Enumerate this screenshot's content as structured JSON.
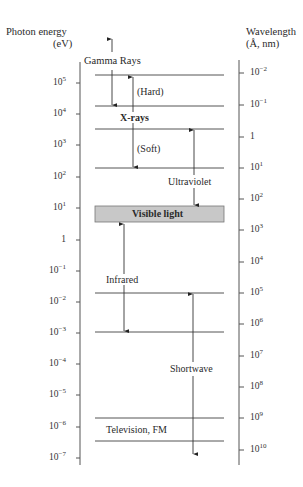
{
  "left_axis": {
    "title_line1": "Photon energy",
    "title_line2": "(eV)",
    "ticks": [
      {
        "base": "10",
        "exp": "5",
        "y": 83
      },
      {
        "base": "10",
        "exp": "4",
        "y": 114
      },
      {
        "base": "10",
        "exp": "3",
        "y": 145
      },
      {
        "base": "10",
        "exp": "2",
        "y": 177
      },
      {
        "base": "10",
        "exp": "1",
        "y": 208
      },
      {
        "base": "1",
        "exp": "",
        "y": 240
      },
      {
        "base": "10",
        "exp": "−1",
        "y": 271
      },
      {
        "base": "10",
        "exp": "−2",
        "y": 302
      },
      {
        "base": "10",
        "exp": "−3",
        "y": 333
      },
      {
        "base": "10",
        "exp": "−4",
        "y": 364
      },
      {
        "base": "10",
        "exp": "−5",
        "y": 395
      },
      {
        "base": "10",
        "exp": "−6",
        "y": 427
      },
      {
        "base": "10",
        "exp": "−7",
        "y": 458
      }
    ]
  },
  "right_axis": {
    "title_line1": "Wavelength",
    "title_line2": "(Å, nm)",
    "ticks": [
      {
        "base": "10",
        "exp": "−2",
        "y": 73
      },
      {
        "base": "10",
        "exp": "−1",
        "y": 105
      },
      {
        "base": "1",
        "exp": "",
        "y": 137
      },
      {
        "base": "10",
        "exp": "1",
        "y": 168
      },
      {
        "base": "10",
        "exp": "2",
        "y": 199
      },
      {
        "base": "10",
        "exp": "3",
        "y": 230
      },
      {
        "base": "10",
        "exp": "4",
        "y": 262
      },
      {
        "base": "10",
        "exp": "5",
        "y": 293
      },
      {
        "base": "10",
        "exp": "6",
        "y": 324
      },
      {
        "base": "10",
        "exp": "7",
        "y": 356
      },
      {
        "base": "10",
        "exp": "8",
        "y": 387
      },
      {
        "base": "10",
        "exp": "9",
        "y": 418
      },
      {
        "base": "10",
        "exp": "10",
        "y": 450
      }
    ]
  },
  "regions": {
    "gamma": "Gamma Rays",
    "hard": "(Hard)",
    "xrays": "X-rays",
    "soft": "(Soft)",
    "ultraviolet": "Ultraviolet",
    "visible": "Visible light",
    "infrared": "Infrared",
    "shortwave": "Shortwave",
    "tv_fm": "Television, FM"
  },
  "colors": {
    "visible_band": "#c8c8c8",
    "lines": "#444444"
  }
}
